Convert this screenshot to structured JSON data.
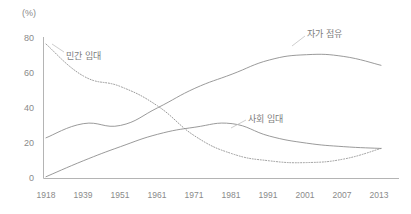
{
  "chart_data": {
    "type": "line",
    "title": "",
    "subtitle": "",
    "xlabel": "",
    "ylabel": "",
    "unit_label": "(%)",
    "grid": false,
    "legend_position": "inline-annotations",
    "categories": [
      "1918",
      "1939",
      "1951",
      "1961",
      "1971",
      "1981",
      "1991",
      "2001",
      "2007",
      "2013"
    ],
    "x": [
      1918,
      1939,
      1951,
      1961,
      1971,
      1981,
      1991,
      2001,
      2007,
      2013
    ],
    "xlim": [
      1918,
      2013
    ],
    "ylim": [
      0,
      80
    ],
    "yticks": [
      0,
      20,
      40,
      60,
      80
    ],
    "ytick_labels": [
      "0",
      "20",
      "40",
      "60",
      "80"
    ],
    "series": [
      {
        "name": "민간 임대",
        "style": "dotted",
        "color": "#9a9a9a",
        "label_x": 1944,
        "label_y": 63,
        "values": [
          76,
          58,
          52,
          41,
          24,
          14,
          10,
          9,
          11,
          17
        ]
      },
      {
        "name": "자가 점유",
        "style": "solid",
        "color": "#8f8f8f",
        "label_x": 1999,
        "label_y": 77,
        "values": [
          23,
          31,
          30,
          40,
          51,
          59,
          67,
          70,
          69,
          64
        ]
      },
      {
        "name": "사회 임대",
        "style": "solid",
        "color": "#8f8f8f",
        "label_x": 1986,
        "label_y": 33,
        "values": [
          1,
          10,
          18,
          25,
          29,
          31,
          24,
          20,
          18,
          17
        ]
      }
    ]
  },
  "axes": {
    "unit_label": "(%)",
    "y_tick_labels": [
      "80",
      "60",
      "40",
      "20",
      "0"
    ],
    "x_tick_labels": [
      "1918",
      "1939",
      "1951",
      "1961",
      "1971",
      "1981",
      "1991",
      "2001",
      "2007",
      "2013"
    ]
  },
  "annotations": {
    "private_rental": "민간 임대",
    "owner_occupied": "자가 점유",
    "social_rental": "사회 임대"
  },
  "colors": {
    "axis": "#b4b4b4",
    "tick_text": "#8a8a8a",
    "series_line": "#8f8f8f",
    "series_dotted": "#9a9a9a",
    "background": "#ffffff"
  }
}
